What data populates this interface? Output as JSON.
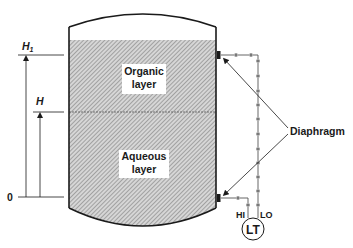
{
  "diagram": {
    "layers": {
      "organic": {
        "line1": "Organic",
        "line2": "layer"
      },
      "aqueous": {
        "line1": "Aqueous",
        "line2": "layer"
      }
    },
    "levels": {
      "h1": {
        "label": "H",
        "subscript": "1"
      },
      "h": {
        "label": "H"
      },
      "zero": {
        "label": "0"
      }
    },
    "callout": {
      "label": "Diaphragm"
    },
    "transmitter": {
      "label": "LT",
      "hi_port": "HI",
      "lo_port": "LO"
    },
    "colors": {
      "line": "#1a1a1a",
      "hatch": "#8a8a8a",
      "hatch_bg": "#d6d6d6",
      "background": "#ffffff"
    }
  }
}
